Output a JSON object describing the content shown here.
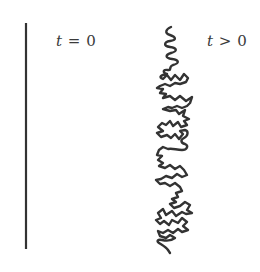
{
  "figure": {
    "background": "#ffffff",
    "stroke_color": "#333333",
    "panels": [
      {
        "id": "initial",
        "label": {
          "var": "t",
          "op": " = ",
          "value": "0"
        },
        "shape": "straight-line",
        "line": {
          "x": 26,
          "y1": 23,
          "y2": 249,
          "width": 2.2
        }
      },
      {
        "id": "later",
        "label": {
          "var": "t",
          "op": " > ",
          "value": "0"
        },
        "shape": "crumpled-chain",
        "stroke_width": 2.4,
        "path": "M171,27 C166,29 164,33 170,35 C176,37 177,40 170,41 C164,42 163,46 170,47 C177,48 178,51 171,53 C165,55 165,58 172,59 C179,60 180,63 173,65 C168,67 172,71 168,70 C162,69 163,73 167,74 C161,75 158,77 163,79 L167,75 L171,80 L175,75 L180,80 L184,74 L188,78 L186,82 L180,84 L175,83 L170,86 L165,84 L160,86 L157,88 L163,89 L160,93 L166,94 L163,98 L170,96 L175,100 L180,96 L186,101 L192,97 L190,103 L187,106 L182,108 L177,106 L172,108 L168,107 L163,109 L170,111 L176,110 L179,114 L185,110 L183,116 L189,119 L184,121 L187,125 L181,127 L178,122 L173,126 L170,121 L166,125 L162,123 L158,127 L163,131 L157,133 L161,137 L167,135 L171,138 L175,134 L179,139 L183,134 L180,131 L185,130 C189,131 188,136 184,138 C180,140 181,143 185,144 C189,146 187,150 182,150 C176,150 173,148 168,149 L163,147 L159,150 L157,155 L162,156 L158,160 L163,163 L159,166 L165,168 L170,165 L175,169 L180,166 L184,170 L187,175 L182,177 L177,174 L172,178 L166,176 L161,179 L156,180 L160,184 L165,183 L170,186 L175,183 L180,187 L182,191 L176,193 L178,197 L172,199 L176,202 L170,204 L174,208 L180,206 L185,202 L190,205 L187,210 L192,213 L186,214 L182,212 L176,216 L172,211 L166,215 L163,209 L158,213 L161,218 L156,220 L160,224 L164,221 L169,225 L172,220 L178,223 L182,218 L187,222 L183,226 L188,230 L182,232 L178,229 L173,233 L168,230 L163,233 L158,231 L160,236 L166,238 L170,235 L175,238 C171,241 166,241 162,240 C158,239 156,241 159,243 C162,245 166,247 168,250 L170,253"
      }
    ]
  }
}
